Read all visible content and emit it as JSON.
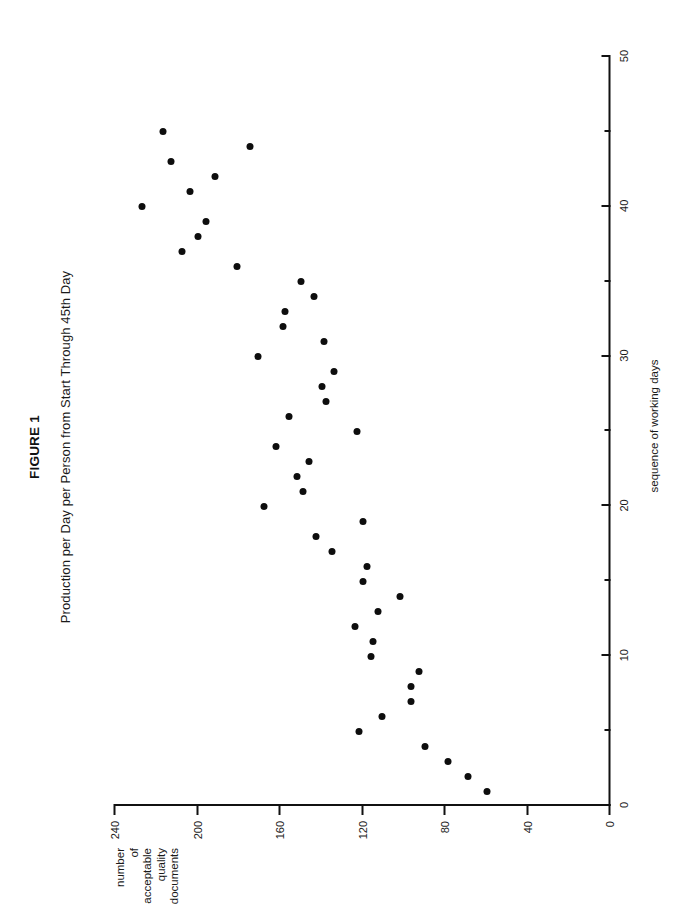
{
  "figure": {
    "title": "FIGURE 1",
    "subtitle": "Production per Day per Person from Start Through 45th Day"
  },
  "chart_data": {
    "type": "scatter",
    "title": "Production per Day per Person from Start Through 45th Day",
    "xlabel": "sequence of working days",
    "ylabel": "number of acceptable quality documents",
    "xlim": [
      0,
      50
    ],
    "ylim": [
      0,
      240
    ],
    "grid": false,
    "legend": null,
    "xticks": [
      0,
      10,
      20,
      30,
      40,
      50
    ],
    "xtick_labels": [
      "0",
      "10",
      "20",
      "30",
      "40",
      "50"
    ],
    "xminor_ticks": [
      5,
      15,
      25,
      35,
      45
    ],
    "yticks": [
      0,
      40,
      80,
      120,
      160,
      200,
      240
    ],
    "ytick_labels": [
      "0",
      "40",
      "80",
      "120",
      "160",
      "200",
      "240"
    ],
    "x": [
      1,
      2,
      3,
      4,
      5,
      6,
      7,
      8,
      9,
      10,
      11,
      12,
      13,
      14,
      15,
      16,
      17,
      18,
      19,
      20,
      21,
      22,
      23,
      24,
      25,
      26,
      27,
      28,
      29,
      30,
      31,
      32,
      33,
      34,
      35,
      36,
      37,
      38,
      39,
      40,
      41,
      42,
      43,
      44,
      45
    ],
    "y": [
      59,
      68,
      78,
      89,
      121,
      110,
      96,
      96,
      92,
      115,
      114,
      123,
      112,
      101,
      119,
      117,
      134,
      142,
      119,
      167,
      148,
      151,
      145,
      161,
      122,
      155,
      137,
      139,
      133,
      170,
      138,
      158,
      157,
      143,
      149,
      180,
      207,
      199,
      195,
      226,
      203,
      191,
      212,
      174,
      216
    ],
    "series": [
      {
        "name": "production per day per person",
        "marker": "filled-circle",
        "color": "#0d0d0d",
        "points": [
          {
            "day": 1,
            "documents": 59
          },
          {
            "day": 2,
            "documents": 68
          },
          {
            "day": 3,
            "documents": 78
          },
          {
            "day": 4,
            "documents": 89
          },
          {
            "day": 5,
            "documents": 121
          },
          {
            "day": 6,
            "documents": 110
          },
          {
            "day": 7,
            "documents": 96
          },
          {
            "day": 8,
            "documents": 96
          },
          {
            "day": 9,
            "documents": 92
          },
          {
            "day": 10,
            "documents": 115
          },
          {
            "day": 11,
            "documents": 114
          },
          {
            "day": 12,
            "documents": 123
          },
          {
            "day": 13,
            "documents": 112
          },
          {
            "day": 14,
            "documents": 101
          },
          {
            "day": 15,
            "documents": 119
          },
          {
            "day": 16,
            "documents": 117
          },
          {
            "day": 17,
            "documents": 134
          },
          {
            "day": 18,
            "documents": 142
          },
          {
            "day": 19,
            "documents": 119
          },
          {
            "day": 20,
            "documents": 167
          },
          {
            "day": 21,
            "documents": 148
          },
          {
            "day": 22,
            "documents": 151
          },
          {
            "day": 23,
            "documents": 145
          },
          {
            "day": 24,
            "documents": 161
          },
          {
            "day": 25,
            "documents": 122
          },
          {
            "day": 26,
            "documents": 155
          },
          {
            "day": 27,
            "documents": 137
          },
          {
            "day": 28,
            "documents": 139
          },
          {
            "day": 29,
            "documents": 133
          },
          {
            "day": 30,
            "documents": 170
          },
          {
            "day": 31,
            "documents": 138
          },
          {
            "day": 32,
            "documents": 158
          },
          {
            "day": 33,
            "documents": 157
          },
          {
            "day": 34,
            "documents": 143
          },
          {
            "day": 35,
            "documents": 149
          },
          {
            "day": 36,
            "documents": 180
          },
          {
            "day": 37,
            "documents": 207
          },
          {
            "day": 38,
            "documents": 199
          },
          {
            "day": 39,
            "documents": 195
          },
          {
            "day": 40,
            "documents": 226
          },
          {
            "day": 41,
            "documents": 203
          },
          {
            "day": 42,
            "documents": 191
          },
          {
            "day": 43,
            "documents": 212
          },
          {
            "day": 44,
            "documents": 174
          },
          {
            "day": 45,
            "documents": 216
          }
        ]
      }
    ]
  },
  "axes": {
    "y_title_lines": [
      "number",
      "of",
      "acceptable",
      "quality",
      "documents"
    ],
    "x_title": "sequence of working days"
  },
  "colors": {
    "marker": "#0d0d0d",
    "axis": "#111111",
    "text": "#1a1a1a",
    "background": "#ffffff"
  }
}
